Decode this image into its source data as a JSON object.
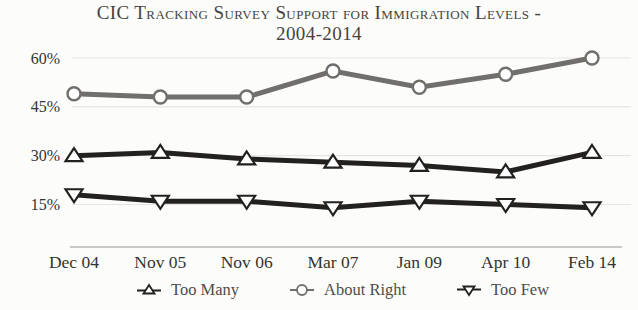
{
  "chart_data": {
    "type": "line",
    "title": "CIC Tracking Survey Support for Immigration Levels - 2004-2014",
    "title_lines": [
      "CIC Tracking Survey Support for Immigration Levels -",
      "2004-2014"
    ],
    "categories": [
      "Dec 04",
      "Nov 05",
      "Nov 06",
      "Mar 07",
      "Jan 09",
      "Apr 10",
      "Feb 14"
    ],
    "series": [
      {
        "name": "Too Many",
        "marker": "triangle-up",
        "color": "#22211f",
        "values": [
          30,
          31,
          29,
          28,
          27,
          25,
          31
        ]
      },
      {
        "name": "About Right",
        "marker": "circle",
        "color": "#716f6c",
        "values": [
          49,
          48,
          48,
          56,
          51,
          55,
          60
        ]
      },
      {
        "name": "Too Few",
        "marker": "triangle-down",
        "color": "#22211f",
        "values": [
          18,
          16,
          16,
          14,
          16,
          15,
          14
        ]
      }
    ],
    "y_ticks": [
      60,
      45,
      30,
      15
    ],
    "y_tick_suffix": "%",
    "xlabel": "",
    "ylabel": "",
    "ylim": [
      10,
      64
    ],
    "grid": true,
    "legend_position": "bottom",
    "marker_fill": "#ffffff"
  },
  "style": {
    "background": "#fcfcfa",
    "grid_color": "#e6e5e1",
    "axis_color": "#b9b8b4",
    "tick_label_color": "#34332f",
    "title_color": "#454440",
    "legend_text_color": "#4e4d49"
  }
}
